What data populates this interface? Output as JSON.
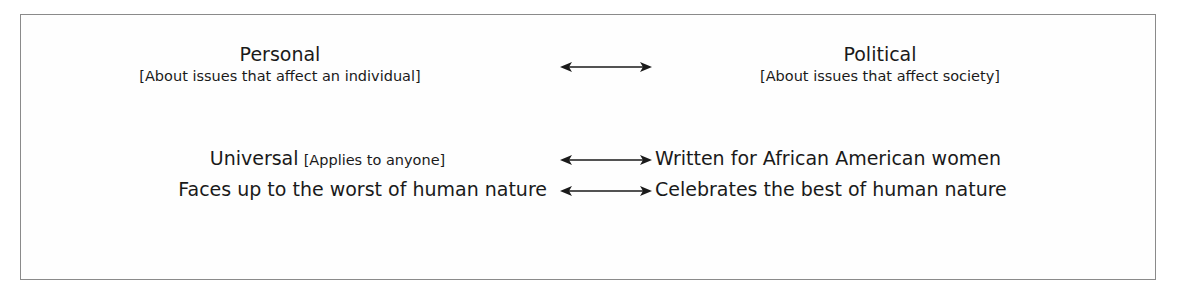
{
  "rows": [
    {
      "left": {
        "title": "Personal",
        "subtitle": "[About issues that affect an individual]"
      },
      "right": {
        "title": "Political",
        "subtitle": "[About issues that affect society]"
      },
      "connector": "double-arrow"
    },
    {
      "left": {
        "title": "Universal",
        "subtitle": "[Applies to anyone]"
      },
      "right": {
        "title": "Written for African American women"
      },
      "connector": "double-arrow"
    },
    {
      "left": {
        "title": "Faces up to the worst of human nature"
      },
      "right": {
        "title": "Celebrates the best of human nature"
      },
      "connector": "double-arrow"
    }
  ],
  "colors": {
    "text": "#1a1a1a",
    "border": "#8a8a8a",
    "background": "#ffffff"
  }
}
